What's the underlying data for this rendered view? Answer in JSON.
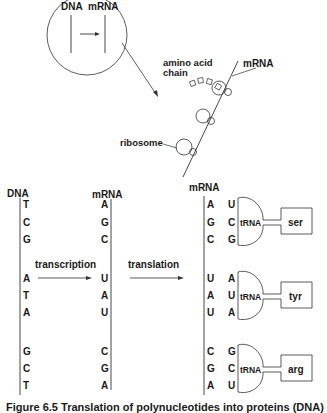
{
  "inset": {
    "labels": [
      "DNA",
      "mRNA"
    ]
  },
  "ribosome_panel": {
    "amino_acid_label_1": "amino acid",
    "amino_acid_label_2": "chain",
    "mrna_label": "mRNA",
    "ribosome_label": "ribosome"
  },
  "transcription": {
    "dna_header": "DNA",
    "mrna_header": "mRNA",
    "dna_bases": [
      "T",
      "C",
      "G",
      "A",
      "T",
      "A",
      "G",
      "C",
      "T"
    ],
    "mrna_bases": [
      "A",
      "G",
      "C",
      "U",
      "A",
      "U",
      "C",
      "G",
      "A"
    ],
    "arrow_label": "transcription"
  },
  "translation": {
    "arrow_label": "translation",
    "mrna_header": "mRNA",
    "mrna_bases": [
      "A",
      "G",
      "C",
      "U",
      "A",
      "U",
      "C",
      "G",
      "A"
    ],
    "anticodons": [
      "U",
      "C",
      "G",
      "A",
      "U",
      "A",
      "G",
      "C",
      "U"
    ],
    "trna_label": "tRNA",
    "amino_acids": [
      "ser",
      "tyr",
      "arg"
    ]
  },
  "caption": "Figure 6.5 Translation of polynucleotides into proteins (DNA)"
}
